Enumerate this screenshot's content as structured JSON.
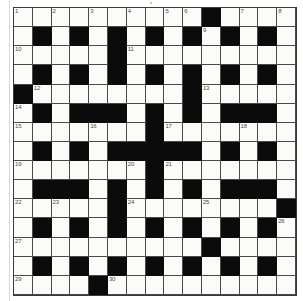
{
  "puzzle": {
    "title": "Crossword Grid",
    "type": "crossword",
    "rows": 15,
    "columns": 15,
    "colors": {
      "block": "#0b0b0b",
      "cell": "#fbfbf8",
      "grid_line": "#4a4a4a",
      "number_text": "#4a4a4a",
      "page_background": "#ffffff"
    },
    "legend": {
      "black_value": 1,
      "white_value": 0
    },
    "grid": [
      [
        0,
        0,
        0,
        0,
        0,
        0,
        0,
        0,
        0,
        0,
        1,
        0,
        0,
        0,
        0
      ],
      [
        0,
        1,
        0,
        1,
        0,
        1,
        0,
        1,
        0,
        1,
        0,
        1,
        0,
        1,
        0
      ],
      [
        0,
        0,
        0,
        0,
        0,
        1,
        0,
        0,
        0,
        0,
        0,
        0,
        0,
        0,
        0
      ],
      [
        0,
        1,
        0,
        1,
        0,
        1,
        0,
        1,
        0,
        1,
        0,
        1,
        0,
        1,
        0
      ],
      [
        1,
        0,
        0,
        0,
        0,
        0,
        0,
        0,
        0,
        1,
        0,
        0,
        0,
        0,
        0
      ],
      [
        0,
        1,
        0,
        1,
        1,
        1,
        0,
        1,
        0,
        1,
        0,
        1,
        1,
        1,
        0
      ],
      [
        0,
        0,
        0,
        0,
        0,
        0,
        0,
        1,
        0,
        0,
        0,
        0,
        0,
        0,
        0
      ],
      [
        0,
        1,
        0,
        1,
        0,
        1,
        1,
        1,
        1,
        1,
        0,
        1,
        0,
        1,
        0
      ],
      [
        0,
        0,
        0,
        0,
        0,
        0,
        0,
        1,
        0,
        0,
        0,
        0,
        0,
        0,
        0
      ],
      [
        0,
        1,
        1,
        1,
        0,
        1,
        0,
        1,
        0,
        1,
        0,
        1,
        1,
        1,
        0
      ],
      [
        0,
        0,
        0,
        0,
        0,
        1,
        0,
        0,
        0,
        0,
        0,
        0,
        0,
        0,
        1
      ],
      [
        0,
        1,
        0,
        1,
        0,
        1,
        0,
        1,
        0,
        1,
        0,
        1,
        0,
        1,
        0
      ],
      [
        0,
        0,
        0,
        0,
        0,
        0,
        0,
        0,
        0,
        0,
        1,
        0,
        0,
        0,
        0
      ],
      [
        0,
        1,
        0,
        1,
        0,
        1,
        0,
        1,
        0,
        1,
        0,
        1,
        0,
        1,
        0
      ],
      [
        0,
        0,
        0,
        0,
        1,
        0,
        0,
        0,
        0,
        0,
        0,
        0,
        0,
        0,
        0
      ]
    ],
    "numbers": [
      {
        "n": 1,
        "row": 1,
        "col": 1
      },
      {
        "n": 2,
        "row": 1,
        "col": 3
      },
      {
        "n": 3,
        "row": 1,
        "col": 5
      },
      {
        "n": 4,
        "row": 1,
        "col": 7
      },
      {
        "n": 5,
        "row": 1,
        "col": 9
      },
      {
        "n": 6,
        "row": 1,
        "col": 10
      },
      {
        "n": 7,
        "row": 1,
        "col": 13
      },
      {
        "n": 8,
        "row": 1,
        "col": 15
      },
      {
        "n": 9,
        "row": 2,
        "col": 11
      },
      {
        "n": 10,
        "row": 3,
        "col": 1
      },
      {
        "n": 11,
        "row": 3,
        "col": 7
      },
      {
        "n": 12,
        "row": 5,
        "col": 2
      },
      {
        "n": 13,
        "row": 5,
        "col": 11
      },
      {
        "n": 14,
        "row": 6,
        "col": 1
      },
      {
        "n": 15,
        "row": 7,
        "col": 1
      },
      {
        "n": 16,
        "row": 7,
        "col": 5
      },
      {
        "n": 17,
        "row": 7,
        "col": 9
      },
      {
        "n": 18,
        "row": 7,
        "col": 13
      },
      {
        "n": 19,
        "row": 9,
        "col": 1
      },
      {
        "n": 20,
        "row": 9,
        "col": 7
      },
      {
        "n": 21,
        "row": 9,
        "col": 9
      },
      {
        "n": 22,
        "row": 11,
        "col": 1
      },
      {
        "n": 23,
        "row": 11,
        "col": 3
      },
      {
        "n": 24,
        "row": 11,
        "col": 7
      },
      {
        "n": 25,
        "row": 11,
        "col": 11
      },
      {
        "n": 26,
        "row": 12,
        "col": 15
      },
      {
        "n": 27,
        "row": 13,
        "col": 1
      },
      {
        "n": 28,
        "row": 13,
        "col": 11
      },
      {
        "n": 29,
        "row": 15,
        "col": 1
      },
      {
        "n": 30,
        "row": 15,
        "col": 6
      }
    ]
  }
}
